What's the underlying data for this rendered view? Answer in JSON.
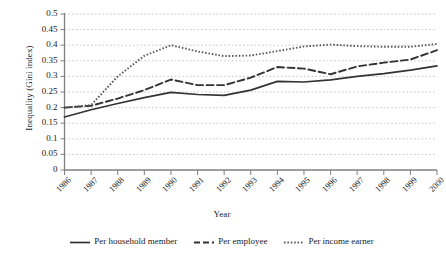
{
  "chart_data": {
    "type": "line",
    "title": "",
    "xlabel": "Year",
    "ylabel": "Inequality (Gini index)",
    "x": [
      1986,
      1987,
      1988,
      1989,
      1990,
      1991,
      1992,
      1993,
      1994,
      1995,
      1996,
      1997,
      1998,
      1999,
      2000
    ],
    "categories": [
      "1986",
      "1987",
      "1988",
      "1989",
      "1990",
      "1991",
      "1992",
      "1993",
      "1994",
      "1995",
      "1996",
      "1997",
      "1998",
      "1999",
      "2000"
    ],
    "xlim": [
      1986,
      2000
    ],
    "ylim": [
      0,
      0.5
    ],
    "yticks": [
      0,
      0.05,
      0.1,
      0.15,
      0.2,
      0.25,
      0.3,
      0.35,
      0.4,
      0.45,
      0.5
    ],
    "ytick_labels": [
      "0",
      "0.05",
      "0.1",
      "0.15",
      "0.2",
      "0.25",
      "0.3",
      "0.35",
      "0.4",
      "0.45",
      "0.5"
    ],
    "grid": true,
    "grid_axis": "y",
    "legend_position": "bottom",
    "series": [
      {
        "name": "Per household member",
        "style": "solid",
        "color": "#333333",
        "values": [
          0.17,
          0.193,
          0.213,
          0.232,
          0.249,
          0.242,
          0.239,
          0.256,
          0.284,
          0.282,
          0.289,
          0.3,
          0.309,
          0.32,
          0.334
        ]
      },
      {
        "name": "Per employee",
        "style": "dashed",
        "color": "#333333",
        "values": [
          0.2,
          0.206,
          0.229,
          0.256,
          0.29,
          0.272,
          0.272,
          0.296,
          0.33,
          0.325,
          0.307,
          0.332,
          0.344,
          0.354,
          0.384
        ]
      },
      {
        "name": "Per income earner",
        "style": "dotted",
        "color": "#555555",
        "values": [
          0.2,
          0.208,
          0.3,
          0.366,
          0.4,
          0.38,
          0.365,
          0.367,
          0.381,
          0.396,
          0.402,
          0.397,
          0.395,
          0.395,
          0.404
        ]
      }
    ]
  },
  "legend": {
    "items": [
      {
        "label": "Per household member",
        "style": "solid"
      },
      {
        "label": "Per employee",
        "style": "dashed"
      },
      {
        "label": "Per income earner",
        "style": "dotted"
      }
    ]
  }
}
